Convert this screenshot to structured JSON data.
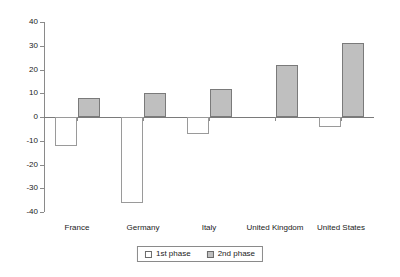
{
  "chart_data": {
    "type": "bar",
    "title": "",
    "subtitle": "",
    "xlabel": "",
    "ylabel": "",
    "categories": [
      "France",
      "Germany",
      "Italy",
      "United Kingdom",
      "United States"
    ],
    "series": [
      {
        "name": "1st phase",
        "values": [
          -12,
          -36,
          -7,
          0,
          -4
        ],
        "color": "#ffffff",
        "border_color": "#9a9a9a"
      },
      {
        "name": "2nd phase",
        "values": [
          8,
          10,
          12,
          22,
          31
        ],
        "color": "#bfbfbf",
        "border_color": "#7a7a7a"
      }
    ],
    "ylim": [
      -40,
      40
    ],
    "ytick_values": [
      40,
      30,
      20,
      10,
      0,
      -10,
      -20,
      -30,
      -40
    ],
    "ytick_labels": [
      "40",
      "30",
      "20",
      "10",
      "0",
      "-10",
      "-20",
      "-30",
      "-40"
    ],
    "grid": false,
    "legend_position": "bottom",
    "zero_line": 0
  },
  "legend": {
    "items": [
      {
        "label": "1st phase",
        "swatch": "open-square-swatch"
      },
      {
        "label": "2nd phase",
        "swatch": "filled-square-swatch"
      }
    ]
  },
  "colors": {
    "phase1_fill": "#ffffff",
    "phase2_fill": "#bfbfbf",
    "axis": "#8a8a8a",
    "text": "#1a1a1a",
    "background": "#ffffff"
  }
}
